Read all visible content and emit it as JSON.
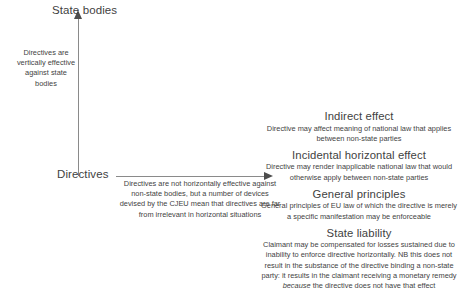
{
  "diagram": {
    "axes": {
      "y_title": "State bodies",
      "x_title": "Directives",
      "y_annotation": "Directives are vertically effective against state bodies",
      "x_annotation": "Directives are not horizontally effective against non-state bodies, but a number of devices devised by the CJEU mean that directives are far from irrelevant in horizontal situations"
    },
    "blocks": [
      {
        "title": "Indirect effect",
        "body": "Directive may affect meaning of national law that applies between non-state parties"
      },
      {
        "title": "Incidental horizontal effect",
        "body": "Directive may render inapplicable national law that would otherwise apply between non-state parties"
      },
      {
        "title": "General principles",
        "body": "General principles of EU law of which the directive is merely a specific manifestation may be enforceable"
      },
      {
        "title": "State liability",
        "body_part1": "Claimant may be compensated for losses sustained due to inability to enforce directive horizontally. NB this does not result in the substance of the directive binding a non-state party: it results in the claimant receiving a monetary remedy ",
        "body_emphasis": "because",
        "body_part2": " the directive does not have that effect"
      }
    ],
    "colors": {
      "background": "#ffffff",
      "text": "#3f3f3f",
      "axis": "#8a8a8a",
      "arrow": "#4d4d4d"
    }
  }
}
